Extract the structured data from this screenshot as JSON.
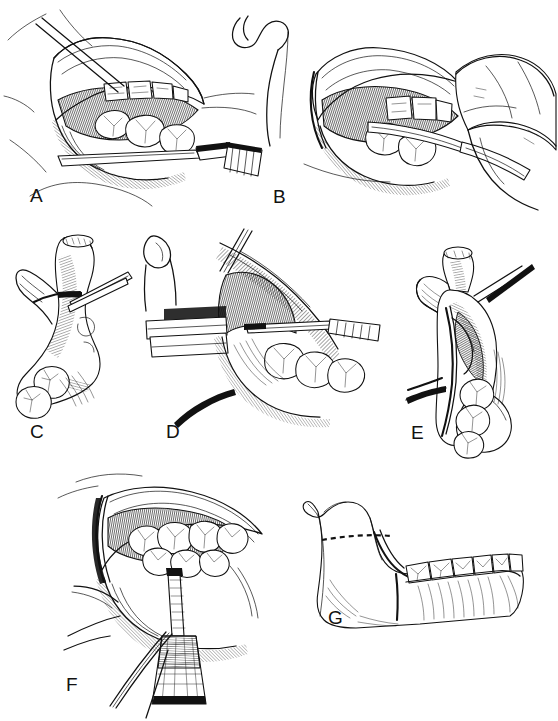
{
  "plate": {
    "title": "Sagittal split ramus osteotomy — operative sequence",
    "medium": "pen-and-ink line drawing",
    "background_color": "#ffffff",
    "ink_color": "#111111",
    "width": 558,
    "height": 721,
    "panel_count": 7
  },
  "panels": [
    {
      "id": "A",
      "label": "A",
      "label_x": 30,
      "label_y": 196,
      "caption": "Intraoral exposure of the mandibular ramus with a channel retractor placed along the inferior border; buccal mucosa reflected to expose maxillary and mandibular molars",
      "contents": [
        "retracted cheek flap",
        "maxillary molars",
        "mandibular molars",
        "channel retractor",
        "periosteal elevator"
      ]
    },
    {
      "id": "B",
      "label": "B",
      "label_x": 273,
      "label_y": 197,
      "caption": "Surgeon's hand introducing a retractor instrument into the medial aspect of the ramus; condyle and coronoid process outlined at left",
      "contents": [
        "surgeon hand",
        "retractor instrument",
        "condyle outline",
        "coronoid process",
        "molars"
      ]
    },
    {
      "id": "C",
      "label": "C",
      "label_x": 30,
      "label_y": 432,
      "caption": "Lateral view of the hemimandible showing the medial horizontal osteotomy cut above the lingula with the instrument in position",
      "contents": [
        "condyle",
        "coronoid process",
        "sigmoid notch",
        "ramus",
        "horizontal osteotomy cut",
        "molar teeth"
      ]
    },
    {
      "id": "D",
      "label": "D",
      "label_x": 166,
      "label_y": 432,
      "caption": "Close view of the medial ramus with two retractor blades in place; reciprocating saw dividing the cortex above the lingula",
      "contents": [
        "upper retractor blade",
        "lower retractor blade",
        "saw blade",
        "medial ramus",
        "molar teeth"
      ]
    },
    {
      "id": "E",
      "label": "E",
      "label_x": 411,
      "label_y": 433,
      "caption": "Medial view of the split ramus with the proximal segment separated; inferior alveolar neurovascular bundle preserved in the distal segment",
      "contents": [
        "condyle",
        "coronoid process",
        "split ramus",
        "neurovascular bundle",
        "molar teeth"
      ]
    },
    {
      "id": "F",
      "label": "F",
      "label_x": 66,
      "label_y": 685,
      "caption": "Buccal vertical osteotomy completed with a handpiece burr at the level of the second molar; mucoperiosteal flap retracted",
      "contents": [
        "surgical handpiece",
        "burr shaft",
        "buccal cortex",
        "mandibular teeth",
        "retracted flap"
      ]
    },
    {
      "id": "G",
      "label": "G",
      "label_x": 328,
      "label_y": 618,
      "caption": "Schematic hemimandible summarizing the cuts: dashed medial horizontal osteotomy across the ramus and solid vertical buccal osteotomy at the second molar",
      "contents": [
        "hemimandible outline",
        "dashed horizontal osteotomy line",
        "solid vertical osteotomy line",
        "full dental arch",
        "condyle",
        "coronoid process"
      ]
    }
  ],
  "osteotomy_lines": {
    "horizontal_style": "dashed",
    "vertical_style": "solid",
    "line_color": "#111111"
  }
}
